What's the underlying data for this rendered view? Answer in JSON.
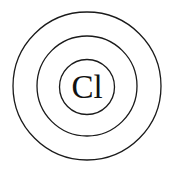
{
  "diagram": {
    "type": "bohr-model",
    "element_symbol": "Cl",
    "shell_count": 3,
    "colors": {
      "stroke": "#1a1a1a",
      "text": "#111111",
      "background": "#ffffff"
    }
  }
}
